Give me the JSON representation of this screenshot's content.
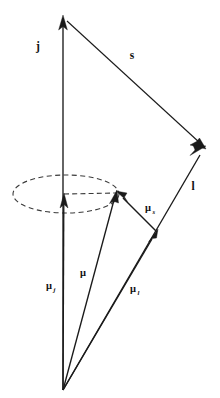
{
  "figure": {
    "background_color": "#ffffff",
    "stroke_color": "#1a1a1a",
    "dash_color": "#3a3a3a"
  },
  "labels": {
    "j": {
      "text": "j",
      "x": 38,
      "y": 50
    },
    "s": {
      "text": "s",
      "x": 132,
      "y": 59
    },
    "l": {
      "text": "l",
      "x": 193,
      "y": 190
    },
    "mu_s": {
      "base": "μ",
      "sub": "s",
      "x": 148,
      "y": 211
    },
    "mu": {
      "base": "μ",
      "sub": "",
      "x": 83,
      "y": 276
    },
    "mu_j": {
      "base": "μ",
      "sub": "j",
      "x": 49,
      "y": 289
    },
    "mu_l": {
      "base": "μ",
      "sub": "l",
      "x": 133,
      "y": 292
    }
  },
  "vectors": [
    {
      "name": "j",
      "from_x": 63,
      "from_y": 390,
      "to_x": 63,
      "to_y": 18,
      "label": "j"
    },
    {
      "name": "s",
      "from_x": 63,
      "from_y": 18,
      "to_x": 205,
      "to_y": 148,
      "label": "s"
    },
    {
      "name": "l",
      "from_x": 63,
      "from_y": 390,
      "to_x": 205,
      "to_y": 148,
      "label": "l"
    },
    {
      "name": "mu_j",
      "from_x": 63,
      "from_y": 390,
      "to_x": 64,
      "to_y": 196,
      "label": "μ_j"
    },
    {
      "name": "mu",
      "from_x": 63,
      "from_y": 390,
      "to_x": 117,
      "to_y": 192,
      "label": "μ"
    },
    {
      "name": "mu_l",
      "from_x": 63,
      "from_y": 390,
      "to_x": 156,
      "to_y": 231,
      "label": "μ_l"
    },
    {
      "name": "mu_s",
      "from_x": 157,
      "from_y": 232,
      "to_x": 117,
      "to_y": 192,
      "label": "μ_s"
    }
  ],
  "precession_cone": {
    "name": "precession-ellipse",
    "center_x": 66,
    "center_y": 194,
    "radius_x": 53,
    "radius_y": 19,
    "style": "dashed",
    "radius_line": {
      "from_x": 64,
      "from_y": 194,
      "to_x": 117,
      "to_y": 193
    }
  }
}
